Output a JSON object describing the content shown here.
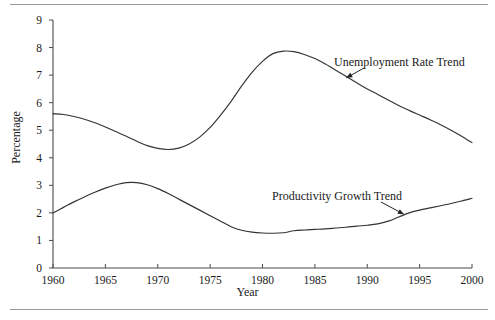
{
  "figure": {
    "background_color": "#ffffff",
    "rule_color": "#9a9a9a",
    "line_color": "#333333",
    "axis_color": "#4a4a4a"
  },
  "chart_data": {
    "type": "line",
    "title": "",
    "xlabel": "Year",
    "ylabel": "Percentage",
    "xlim": [
      1960,
      2000
    ],
    "ylim": [
      0,
      9
    ],
    "xticks": [
      1960,
      1965,
      1970,
      1975,
      1980,
      1985,
      1990,
      1995,
      2000
    ],
    "xtick_labels": [
      "1960",
      "1965",
      "1970",
      "1975",
      "1980",
      "1985",
      "1990",
      "1995",
      "2000"
    ],
    "yticks": [
      0,
      1,
      2,
      3,
      4,
      5,
      6,
      7,
      8,
      9
    ],
    "ytick_labels": [
      "0",
      "1",
      "2",
      "3",
      "4",
      "5",
      "6",
      "7",
      "8",
      "9"
    ],
    "grid": false,
    "legend": "none",
    "annotations": [
      {
        "text": "Unemployment Rate Trend",
        "series": "Unemployment Rate Trend",
        "points_to_year": 1988,
        "points_to_value": 6.9
      },
      {
        "text": "Productivity Growth Trend",
        "series": "Productivity Growth Trend",
        "points_to_year": 1993.5,
        "points_to_value": 1.95
      }
    ],
    "x": [
      1960,
      1961,
      1962,
      1963,
      1964,
      1965,
      1966,
      1967,
      1968,
      1969,
      1970,
      1971,
      1972,
      1973,
      1974,
      1975,
      1976,
      1977,
      1978,
      1979,
      1980,
      1981,
      1982,
      1983,
      1984,
      1985,
      1986,
      1987,
      1988,
      1989,
      1990,
      1991,
      1992,
      1993,
      1994,
      1995,
      1996,
      1997,
      1998,
      1999,
      2000
    ],
    "series": [
      {
        "name": "Unemployment Rate Trend",
        "values": [
          5.6,
          5.57,
          5.5,
          5.4,
          5.27,
          5.12,
          4.95,
          4.78,
          4.6,
          4.44,
          4.34,
          4.3,
          4.35,
          4.5,
          4.75,
          5.1,
          5.55,
          6.05,
          6.6,
          7.1,
          7.5,
          7.78,
          7.87,
          7.85,
          7.75,
          7.6,
          7.4,
          7.18,
          6.95,
          6.72,
          6.5,
          6.3,
          6.1,
          5.9,
          5.72,
          5.55,
          5.38,
          5.2,
          5.0,
          4.78,
          4.55
        ]
      },
      {
        "name": "Productivity Growth Trend",
        "values": [
          2.0,
          2.2,
          2.4,
          2.58,
          2.75,
          2.9,
          3.02,
          3.1,
          3.1,
          3.02,
          2.88,
          2.7,
          2.5,
          2.3,
          2.1,
          1.9,
          1.7,
          1.5,
          1.37,
          1.3,
          1.27,
          1.26,
          1.28,
          1.35,
          1.38,
          1.4,
          1.42,
          1.45,
          1.48,
          1.52,
          1.55,
          1.6,
          1.7,
          1.85,
          2.0,
          2.1,
          2.18,
          2.26,
          2.34,
          2.43,
          2.53
        ]
      }
    ]
  }
}
